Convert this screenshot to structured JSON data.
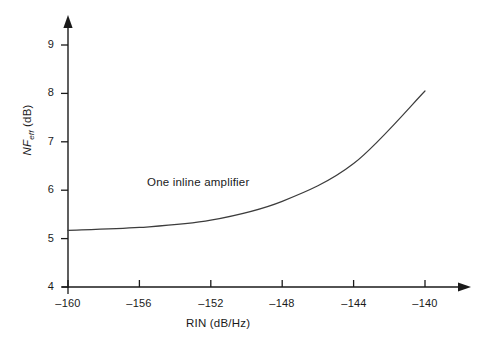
{
  "chart_data": {
    "type": "line",
    "title": "",
    "xlabel": "RIN (dB/Hz)",
    "ylabel": "NF_eff (dB)",
    "ylabel_parts": {
      "main": "NF",
      "subscript": "eff",
      "unit": " (dB)"
    },
    "x": [
      -160,
      -156,
      -152,
      -148,
      -144,
      -140
    ],
    "values": [
      5.17,
      5.23,
      5.38,
      5.77,
      6.55,
      8.05
    ],
    "series": [
      {
        "name": "One inline amplifier",
        "values": [
          5.17,
          5.23,
          5.38,
          5.77,
          6.55,
          8.05
        ]
      }
    ],
    "xlim": [
      -160,
      -140
    ],
    "ylim": [
      4,
      9
    ],
    "xticks": [
      -160,
      -156,
      -152,
      -148,
      -144,
      -140
    ],
    "yticks": [
      4,
      5,
      6,
      7,
      8,
      9
    ],
    "xtick_labels": [
      "–160",
      "–156",
      "–152",
      "–148",
      "–144",
      "–140"
    ],
    "ytick_labels": [
      "4",
      "5",
      "6",
      "7",
      "8",
      "9"
    ],
    "grid": false,
    "legend": "none",
    "annotations": [
      {
        "text": "One inline amplifier",
        "x": -153.5,
        "y": 6.2
      }
    ],
    "line_color": "#3c3c3c",
    "axis_color": "#1a1a1a",
    "background_color": "#ffffff"
  }
}
